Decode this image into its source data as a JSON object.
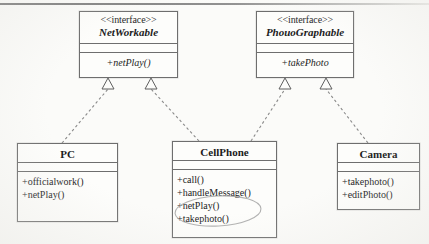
{
  "diagram": {
    "title_text": "",
    "background_color": "#fbfbf9",
    "line_color": "#6e6e6e",
    "text_color": "#1b1b1b",
    "annotation_color": "#8f8f8f",
    "relationship_type": "realization",
    "notation": "UML class diagram"
  },
  "interfaces": [
    {
      "id": "networkable",
      "stereotype": "<<interface>>",
      "name": "NetWorkable",
      "attributes": [],
      "operations": [
        "+netPlay()"
      ]
    },
    {
      "id": "phouographable",
      "stereotype": "<<interface>>",
      "name": "PhouoGraphable",
      "attributes": [],
      "operations": [
        "+takePhoto"
      ]
    }
  ],
  "classes": [
    {
      "id": "pc",
      "name": "PC",
      "attributes": [],
      "operations": [
        "+officialwork()",
        "+netPlay()"
      ]
    },
    {
      "id": "cellphone",
      "name": "CellPhone",
      "attributes": [],
      "operations": [
        "+call()",
        "+handleMessage()",
        "+netPlay()",
        "+takephoto()"
      ]
    },
    {
      "id": "camera",
      "name": "Camera",
      "attributes": [],
      "operations": [
        "+takephoto()",
        "+editPhoto()"
      ]
    }
  ],
  "relationships": [
    {
      "from": "pc",
      "to": "networkable",
      "type": "realization",
      "label": ""
    },
    {
      "from": "cellphone",
      "to": "networkable",
      "type": "realization",
      "label": ""
    },
    {
      "from": "cellphone",
      "to": "phouographable",
      "type": "realization",
      "label": ""
    },
    {
      "from": "camera",
      "to": "phouographable",
      "type": "realization",
      "label": ""
    }
  ],
  "annotations": [
    {
      "id": "cellphone-highlight",
      "shape": "ellipse",
      "target": "cellphone.operations.netPlay-takephoto",
      "note": "hand-drawn ellipse around +netPlay() and +takephoto()"
    }
  ]
}
